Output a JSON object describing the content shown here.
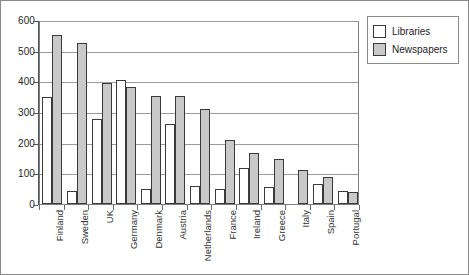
{
  "chart_data": {
    "type": "bar",
    "title": "",
    "subtitle": "",
    "xlabel": "",
    "ylabel": "",
    "ylim": [
      0,
      600
    ],
    "ytick_labels": [
      "0",
      "100",
      "200",
      "300",
      "400",
      "500",
      "600"
    ],
    "ytick_values": [
      0,
      100,
      200,
      300,
      400,
      500,
      600
    ],
    "grid": true,
    "legend_position": "right-outside",
    "categories": [
      "Finland",
      "Sweden",
      "UK",
      "Germany",
      "Denmark",
      "Austria",
      "Netherlands",
      "France",
      "Ireland",
      "Greece",
      "Italy",
      "Spain",
      "Portugal"
    ],
    "series": [
      {
        "name": "Libraries",
        "color": "#ffffff",
        "values": [
          350,
          42,
          278,
          405,
          50,
          260,
          60,
          48,
          118,
          55,
          null,
          65,
          42
        ]
      },
      {
        "name": "Newspapers",
        "color": "#c9c9c9",
        "values": [
          550,
          525,
          395,
          383,
          352,
          352,
          311,
          210,
          165,
          147,
          112,
          88,
          40
        ]
      }
    ]
  },
  "legend": {
    "items": [
      {
        "label": "Libraries",
        "swatch": "libraries"
      },
      {
        "label": "Newspapers",
        "swatch": "newspapers"
      }
    ]
  }
}
